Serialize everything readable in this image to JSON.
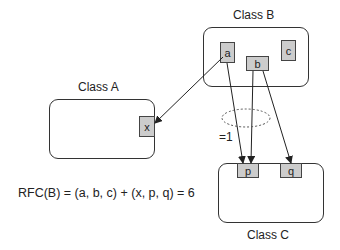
{
  "classes": {
    "class_a": {
      "title": "Class A",
      "attributes": [
        "x"
      ]
    },
    "class_b": {
      "title": "Class B",
      "attributes": [
        "a",
        "b",
        "c"
      ]
    },
    "class_c": {
      "title": "Class C",
      "attributes": [
        "p",
        "q"
      ]
    }
  },
  "arrows": [
    {
      "from": "a",
      "to": "x"
    },
    {
      "from": "a",
      "to": "p"
    },
    {
      "from": "b",
      "to": "p"
    },
    {
      "from": "b",
      "to": "q"
    }
  ],
  "annotation": {
    "ellipse_label": "=1"
  },
  "formula": "RFC(B) = (a, b, c) + (x, p, q) = 6",
  "colors": {
    "line": "#222222",
    "attr_fill": "#cccccc",
    "box_border": "#333333"
  }
}
